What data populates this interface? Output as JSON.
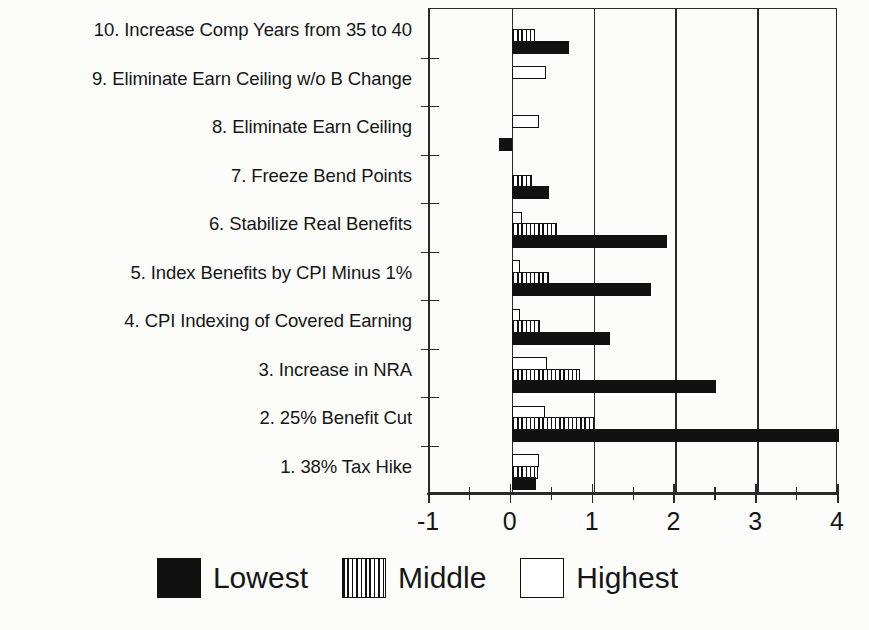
{
  "chart_data": {
    "type": "bar",
    "orientation": "horizontal",
    "title": "",
    "xlabel": "",
    "ylabel": "",
    "xlim": [
      -1,
      4
    ],
    "xticks": [
      -1,
      0,
      1,
      2,
      3,
      4
    ],
    "xticklabels": [
      "-1",
      "0",
      "1",
      "2",
      "3",
      "4"
    ],
    "minor_xticks": [
      -0.5,
      0.5,
      1.5,
      2.5,
      3.5
    ],
    "grid": "vertical-only",
    "legend_position": "bottom-center",
    "categories": [
      "1.  38% Tax Hike",
      "2.  25% Benefit Cut",
      "3.  Increase in NRA",
      "4.  CPI Indexing of Covered Earning",
      "5.  Index Benefits by CPI Minus 1%",
      "6.  Stabilize Real Benefits",
      "7.  Freeze Bend Points",
      "8.  Eliminate Earn Ceiling",
      "9.  Eliminate Earn Ceiling w/o B Change",
      "10. Increase Comp Years from 35 to 40"
    ],
    "series": [
      {
        "name": "Lowest",
        "fill": "solid-black",
        "color": "#111111",
        "values": [
          0.3,
          4.0,
          2.5,
          1.2,
          1.7,
          1.9,
          0.45,
          -0.16,
          0.0,
          0.7
        ]
      },
      {
        "name": "Middle",
        "fill": "vertical-stripes",
        "color": "#111111",
        "values": [
          0.32,
          1.0,
          0.83,
          0.35,
          0.45,
          0.55,
          0.25,
          0.0,
          0.0,
          0.28
        ]
      },
      {
        "name": "Highest",
        "fill": "white",
        "color": "#ffffff",
        "values": [
          0.33,
          0.4,
          0.43,
          0.1,
          0.1,
          0.12,
          0.0,
          0.33,
          0.42,
          0.0
        ]
      }
    ]
  },
  "legend": {
    "entries": [
      {
        "label": "Lowest",
        "swatch": "solid-black"
      },
      {
        "label": "Middle",
        "swatch": "vertical-stripes"
      },
      {
        "label": "Highest",
        "swatch": "white"
      }
    ]
  }
}
